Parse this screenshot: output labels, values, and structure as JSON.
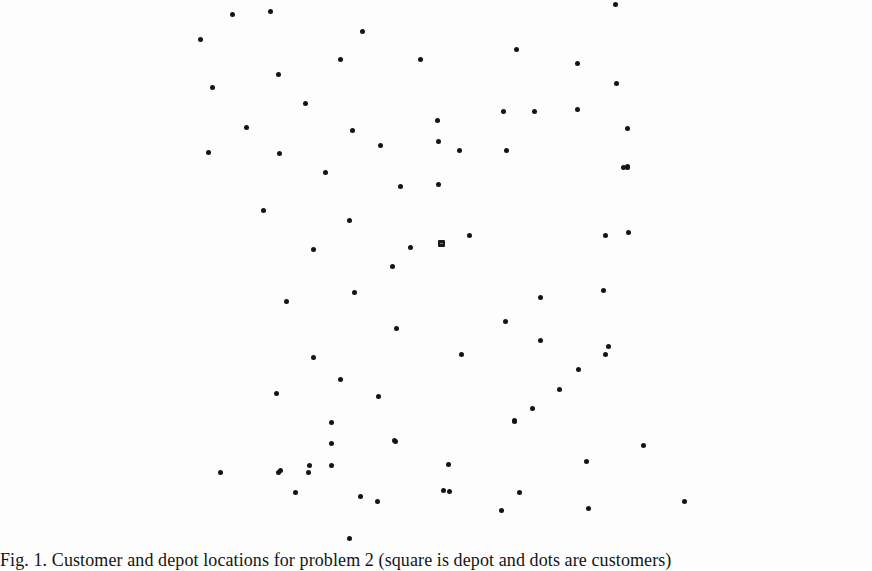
{
  "figure": {
    "caption": "Fig. 1. Customer and depot locations for problem 2 (square is depot and dots are customers)",
    "legend": {
      "depot_marker": "square",
      "customer_marker": "dot"
    }
  },
  "chart_data": {
    "type": "scatter",
    "title": "Customer and depot locations for problem 2",
    "xlabel": "",
    "ylabel": "",
    "axes_visible": false,
    "grid": false,
    "legend_position": "caption",
    "coordinate_space": "pixel (872x548 plot area, origin top-left)",
    "series": [
      {
        "name": "depot",
        "marker": "square",
        "points": [
          [
            441,
            243
          ]
        ]
      },
      {
        "name": "customers",
        "marker": "dot",
        "points": [
          [
            232,
            14
          ],
          [
            270,
            11
          ],
          [
            200,
            39
          ],
          [
            362,
            31
          ],
          [
            340,
            59
          ],
          [
            212,
            87
          ],
          [
            278,
            74
          ],
          [
            420,
            59
          ],
          [
            516,
            49
          ],
          [
            577,
            63
          ],
          [
            616,
            83
          ],
          [
            615,
            4
          ],
          [
            305,
            103
          ],
          [
            246,
            127
          ],
          [
            352,
            130
          ],
          [
            208,
            152
          ],
          [
            279,
            153
          ],
          [
            325,
            172
          ],
          [
            380,
            145
          ],
          [
            400,
            186
          ],
          [
            438,
            184
          ],
          [
            437,
            120
          ],
          [
            503,
            111
          ],
          [
            534,
            111
          ],
          [
            577,
            109
          ],
          [
            438,
            141
          ],
          [
            459,
            150
          ],
          [
            506,
            150
          ],
          [
            627,
            166
          ],
          [
            627,
            128
          ],
          [
            623,
            167
          ],
          [
            627,
            167
          ],
          [
            627,
            166
          ],
          [
            263,
            210
          ],
          [
            349,
            220
          ],
          [
            400,
            186
          ],
          [
            313,
            249
          ],
          [
            410,
            247
          ],
          [
            392,
            266
          ],
          [
            286,
            301
          ],
          [
            354,
            292
          ],
          [
            396,
            328
          ],
          [
            313,
            357
          ],
          [
            469,
            235
          ],
          [
            605,
            235
          ],
          [
            628,
            232
          ],
          [
            540,
            297
          ],
          [
            505,
            321
          ],
          [
            603,
            290
          ],
          [
            540,
            340
          ],
          [
            461,
            354
          ],
          [
            608,
            346
          ],
          [
            605,
            354
          ],
          [
            340,
            379
          ],
          [
            276,
            393
          ],
          [
            378,
            396
          ],
          [
            331,
            422
          ],
          [
            394,
            440
          ],
          [
            278,
            472
          ],
          [
            308,
            472
          ],
          [
            331,
            465
          ],
          [
            514,
            421
          ],
          [
            559,
            389
          ],
          [
            532,
            408
          ],
          [
            514,
            420
          ],
          [
            578,
            369
          ],
          [
            220,
            472
          ],
          [
            280,
            470
          ],
          [
            309,
            465
          ],
          [
            331,
            443
          ],
          [
            395,
            441
          ],
          [
            360,
            496
          ],
          [
            443,
            490
          ],
          [
            448,
            464
          ],
          [
            643,
            445
          ],
          [
            586,
            461
          ],
          [
            519,
            492
          ],
          [
            588,
            508
          ],
          [
            295,
            492
          ],
          [
            377,
            501
          ],
          [
            349,
            538
          ],
          [
            449,
            491
          ],
          [
            501,
            510
          ],
          [
            684,
            501
          ]
        ]
      }
    ]
  }
}
